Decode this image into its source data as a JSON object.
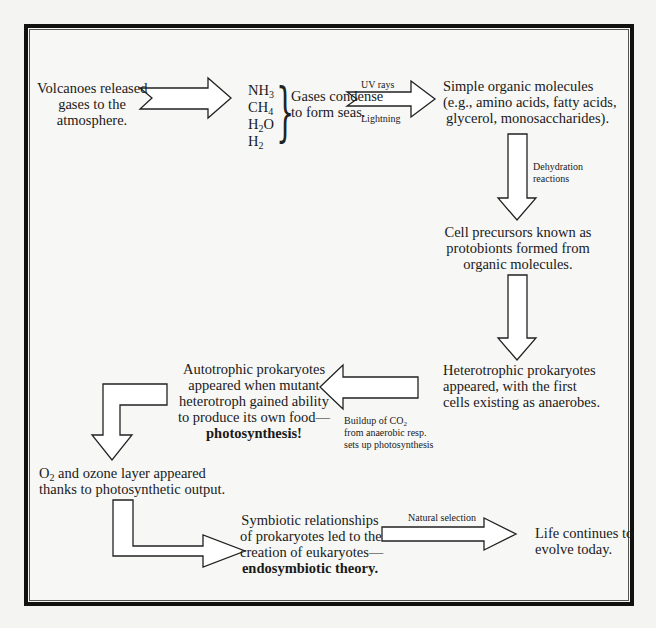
{
  "diagram": {
    "nodes": {
      "volcanoes": [
        "Volcanoes released",
        "gases to the",
        "atmosphere."
      ],
      "gases": [
        {
          "base": "NH",
          "sub": "3"
        },
        {
          "base": "CH",
          "sub": "4"
        },
        {
          "base": "H",
          "sub": "2",
          "tail": "O"
        },
        {
          "base": "H",
          "sub": "2"
        }
      ],
      "condense": [
        "Gases condense",
        "to form seas."
      ],
      "simple_organic": [
        "Simple organic molecules",
        "(e.g., amino acids, fatty acids,",
        "glycerol, monosaccharides)."
      ],
      "protobionts": [
        "Cell precursors known as",
        "protobionts formed from",
        "organic molecules."
      ],
      "heterotrophic": [
        "Heterotrophic prokaryotes",
        "appeared, with the first",
        "cells existing as anaerobes."
      ],
      "autotrophic": [
        "Autotrophic prokaryotes",
        "appeared when mutant",
        "heterotroph gained ability",
        "to produce its own food—"
      ],
      "autotrophic_bold": "photosynthesis!",
      "oxygen": {
        "o2_base": "O",
        "o2_sub": "2",
        "line1_rest": " and ozone layer appeared",
        "line2": "thanks to photosynthetic output."
      },
      "symbiotic": [
        "Symbiotic relationships",
        "of prokaryotes led to the",
        "creation of eukaryotes—"
      ],
      "symbiotic_bold": "endosymbiotic theory.",
      "life": [
        "Life continues to",
        "evolve today."
      ]
    },
    "edge_labels": {
      "uv": "UV rays",
      "lightning": "Lightning",
      "dehydration": [
        "Dehydration",
        "reactions"
      ],
      "co2_line1_base": "Buildup of CO",
      "co2_line1_sub": "2",
      "co2_line2": "from anaerobic resp.",
      "co2_line3": "sets up photosynthesis",
      "natural_selection": "Natural selection"
    }
  }
}
